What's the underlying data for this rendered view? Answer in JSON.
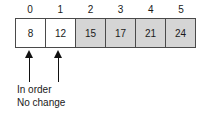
{
  "diagram": {
    "type": "array-diagram",
    "colors": {
      "cell_border": "#4a4a4a",
      "cell_unshaded": "#ffffff",
      "cell_shaded": "#d5d5d5",
      "arrow": "#111111",
      "text": "#1a1a1a",
      "background": "#ffffff"
    },
    "indices": [
      "0",
      "1",
      "2",
      "3",
      "4",
      "5"
    ],
    "cells": [
      {
        "index": "0",
        "value": "8",
        "shaded": false
      },
      {
        "index": "1",
        "value": "12",
        "shaded": false
      },
      {
        "index": "2",
        "value": "15",
        "shaded": true
      },
      {
        "index": "3",
        "value": "17",
        "shaded": true
      },
      {
        "index": "4",
        "value": "21",
        "shaded": true
      },
      {
        "index": "5",
        "value": "24",
        "shaded": true
      }
    ],
    "arrows": [
      {
        "name": "arrow-index-0",
        "points_to_index": "0",
        "direction": "up"
      },
      {
        "name": "arrow-index-1",
        "points_to_index": "1",
        "direction": "up"
      }
    ],
    "caption": {
      "line1": "In order",
      "line2": "No change"
    }
  }
}
